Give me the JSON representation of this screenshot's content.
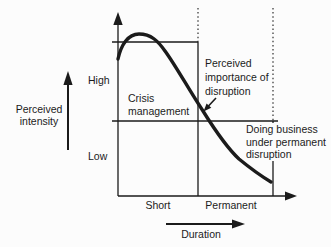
{
  "colors": {
    "ink": "#1b1b1b",
    "background": "#fcfcfc"
  },
  "labels": {
    "y_axis": [
      "Perceived",
      "intensity"
    ],
    "high": "High",
    "low": "Low",
    "crisis": [
      "Crisis",
      "management"
    ],
    "importance": [
      "Perceived",
      "importance of",
      "disruption"
    ],
    "doing_business": [
      "Doing business",
      "under permanent",
      "disruption"
    ],
    "short": "Short",
    "permanent": "Permanent",
    "duration": "Duration"
  }
}
